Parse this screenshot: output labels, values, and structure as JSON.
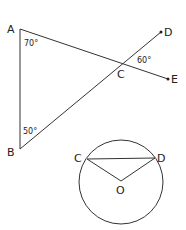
{
  "figure1": {
    "points": {
      "A": {
        "label": "A"
      },
      "B": {
        "label": "B"
      },
      "C": {
        "label": "C"
      },
      "D": {
        "label": "D"
      },
      "E": {
        "label": "E"
      }
    },
    "angles": {
      "A": "70°",
      "B": "50°",
      "DCE": "60°"
    }
  },
  "figure2": {
    "points": {
      "C": {
        "label": "C"
      },
      "D": {
        "label": "D"
      },
      "O": {
        "label": "O"
      }
    }
  }
}
